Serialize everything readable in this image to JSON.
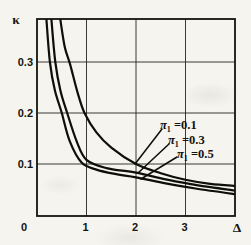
{
  "page": {
    "background": "#f5f4ee",
    "ink": "#131310"
  },
  "chart_data": {
    "type": "line",
    "title": "",
    "xlabel": "Δ",
    "ylabel": "κ",
    "xlim": [
      0,
      4
    ],
    "ylim": [
      0,
      0.385
    ],
    "grid": true,
    "legend_position": "inside-right",
    "x_ticks": {
      "values": [
        1,
        2,
        3
      ],
      "labels": [
        "1",
        "2",
        "3"
      ]
    },
    "y_ticks": {
      "values": [
        0.1,
        0.2,
        0.3
      ],
      "labels": [
        "0.1",
        "0.2",
        "0.3"
      ]
    },
    "origin_label": "0",
    "series": [
      {
        "name": "π₁ = 0.1",
        "points": [
          [
            0.47,
            0.384
          ],
          [
            0.56,
            0.33
          ],
          [
            0.67,
            0.295
          ],
          [
            0.82,
            0.24
          ],
          [
            0.96,
            0.2
          ],
          [
            1.2,
            0.162
          ],
          [
            1.5,
            0.132
          ],
          [
            2.0,
            0.1
          ],
          [
            2.5,
            0.082
          ],
          [
            3.0,
            0.069
          ],
          [
            3.5,
            0.061
          ],
          [
            4.0,
            0.057
          ]
        ]
      },
      {
        "name": "π₁ = 0.3",
        "points": [
          [
            0.29,
            0.384
          ],
          [
            0.37,
            0.3
          ],
          [
            0.47,
            0.245
          ],
          [
            0.61,
            0.2
          ],
          [
            0.8,
            0.145
          ],
          [
            1.0,
            0.108
          ],
          [
            1.4,
            0.092
          ],
          [
            2.0,
            0.083
          ],
          [
            2.6,
            0.07
          ],
          [
            3.2,
            0.059
          ],
          [
            4.0,
            0.048
          ]
        ]
      },
      {
        "name": "π₁ = 0.5",
        "points": [
          [
            0.19,
            0.384
          ],
          [
            0.26,
            0.3
          ],
          [
            0.36,
            0.245
          ],
          [
            0.5,
            0.2
          ],
          [
            0.66,
            0.145
          ],
          [
            0.9,
            0.103
          ],
          [
            1.2,
            0.089
          ],
          [
            1.6,
            0.08
          ],
          [
            2.0,
            0.074
          ],
          [
            2.6,
            0.062
          ],
          [
            3.2,
            0.052
          ],
          [
            4.0,
            0.041
          ]
        ]
      }
    ],
    "legend": [
      {
        "symbol": "π",
        "subscript": "1",
        "value": " =0.1"
      },
      {
        "symbol": "π",
        "subscript": "1",
        "value": " =0.3"
      },
      {
        "symbol": "π",
        "subscript": "1",
        "value": " =0.5"
      }
    ]
  }
}
